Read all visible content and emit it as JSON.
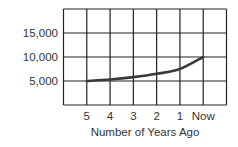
{
  "chart_data": {
    "type": "line",
    "title": "",
    "xlabel": "Number of Years Ago",
    "ylabel": "",
    "categories": [
      "5",
      "4",
      "3",
      "2",
      "1",
      "Now"
    ],
    "series": [
      {
        "name": "value",
        "values": [
          5000,
          5300,
          5800,
          6500,
          7500,
          10000
        ]
      }
    ],
    "yticks": [
      5000,
      10000,
      15000
    ],
    "ytick_labels": [
      "5,000",
      "10,000",
      "15,000"
    ],
    "ylim": [
      0,
      20000
    ],
    "grid": true,
    "legend": "none"
  },
  "colors": {
    "line": "#333333",
    "grid": "#222222"
  }
}
